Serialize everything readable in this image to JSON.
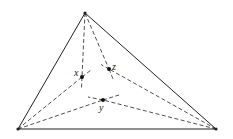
{
  "diagram": {
    "type": "triangle-interior-points",
    "vertices": {
      "top": [
        85,
        13
      ],
      "left": [
        18,
        129
      ],
      "right": [
        216,
        129
      ]
    },
    "points": [
      {
        "label": "x",
        "pos": [
          82,
          77
        ],
        "label_pos": [
          74,
          76
        ]
      },
      {
        "label": "z",
        "pos": [
          109,
          69
        ],
        "label_pos": [
          112,
          69
        ]
      },
      {
        "label": "y",
        "pos": [
          103,
          100
        ],
        "label_pos": [
          99,
          111
        ]
      }
    ],
    "colors": {
      "stroke": "#222222",
      "background": "#ffffff"
    }
  }
}
